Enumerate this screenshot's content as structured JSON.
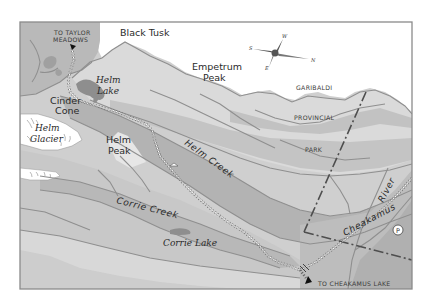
{
  "map": {
    "title": "Helm Creek trail map",
    "colors": {
      "frame": "#8a8a8a",
      "paper": "#ffffff",
      "valley": "#bdbdbd",
      "slope_light": "#d4d4d4",
      "slope_mid": "#c6c6c6",
      "slope_dark": "#a8a8a8",
      "lake": "#8e8e8e",
      "river_line": "#8f8f8f",
      "trail": "#ffffff",
      "boundary": "#5a5a5a",
      "text": "#2a2a2a"
    },
    "compass": {
      "icon": "compass-rose-icon",
      "labels": {
        "north": "N",
        "south": "S",
        "east": "E",
        "west": "W"
      }
    },
    "labels": {
      "to_taylor_line1": "TO TAYLOR",
      "to_taylor_line2": "MEADOWS",
      "black_tusk": "Black Tusk",
      "empetrum_line1": "Empetrum",
      "empetrum_line2": "Peak",
      "helm_lake_line1": "Helm",
      "helm_lake_line2": "Lake",
      "cinder_line1": "Cinder",
      "cinder_line2": "Cone",
      "glacier_line1": "Helm",
      "glacier_line2": "Glacier",
      "helm_peak_line1": "Helm",
      "helm_peak_line2": "Peak",
      "helm_creek": "Helm Creek",
      "corrie_creek": "Corrie Creek",
      "corrie_lake": "Corrie Lake",
      "park_line1": "GARIBALDI",
      "park_line2": "PROVINCIAL",
      "park_line3": "PARK",
      "cheakamus_river_1": "Cheakamus",
      "cheakamus_river_2": "River",
      "to_cheakamus_lake": "TO CHEAKAMUS LAKE",
      "parking": "P"
    },
    "icons": {
      "trail_arrow_north": "arrow-icon",
      "trail_arrow_south": "arrow-icon",
      "parking": "parking-icon",
      "bridge": "bridge-icon",
      "campsite": "campsite-icon"
    }
  }
}
